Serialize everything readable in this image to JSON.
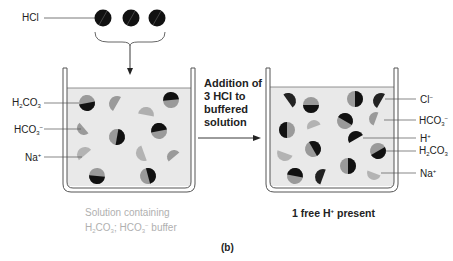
{
  "figure_label": "(b)",
  "reagent": {
    "label": "HCl",
    "count": 3
  },
  "middle_text": {
    "lines": [
      "Addition of",
      "3 HCl to",
      "buffered",
      "solution"
    ]
  },
  "left_beaker": {
    "labels": [
      {
        "base": "H",
        "sub1": "2",
        "mid": "CO",
        "sub2": "3",
        "sup": ""
      },
      {
        "base": "HCO",
        "sub1": "3",
        "mid": "",
        "sub2": "",
        "sup": "−"
      },
      {
        "base": "Na",
        "sub1": "",
        "mid": "",
        "sub2": "",
        "sup": "+"
      }
    ],
    "caption_line1": "Solution containing",
    "caption_line2": {
      "a": "H",
      "a_sub": "2",
      "b": "CO",
      "b_sub": "3",
      "c": "; HCO",
      "c_sub": "3",
      "c_sup": "−",
      "d": " buffer"
    }
  },
  "right_beaker": {
    "labels": [
      {
        "base": "Cl",
        "sub1": "",
        "mid": "",
        "sub2": "",
        "sup": "−"
      },
      {
        "base": "HCO",
        "sub1": "3",
        "mid": "",
        "sub2": "",
        "sup": "−"
      },
      {
        "base": "H",
        "sub1": "",
        "mid": "",
        "sub2": "",
        "sup": "+"
      },
      {
        "base": "H",
        "sub1": "2",
        "mid": "CO",
        "sub2": "3",
        "sup": ""
      },
      {
        "base": "Na",
        "sub1": "",
        "mid": "",
        "sub2": "",
        "sup": "+"
      }
    ],
    "caption": {
      "a": "1 free H",
      "sup": "+",
      "b": " present"
    }
  },
  "colors": {
    "dark": "#111111",
    "gray": "#9a9a9a",
    "light_gray": "#b3b3b3",
    "solution": "#e9e9e9",
    "beaker_line": "#555555"
  }
}
